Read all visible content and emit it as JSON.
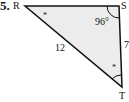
{
  "problem_number": "5.",
  "vertices": {
    "R": {
      "label": "R",
      "x": 25,
      "y": 6
    },
    "S": {
      "label": "S",
      "x": 119,
      "y": 6
    },
    "T": {
      "label": "T",
      "x": 122,
      "y": 87
    }
  },
  "angle_S": "96°",
  "side_RT": "12",
  "side_ST": "7",
  "angle_marks": {
    "R": "*",
    "T": "*"
  },
  "colors": {
    "fill": "#ececec",
    "stroke": "#111111"
  }
}
